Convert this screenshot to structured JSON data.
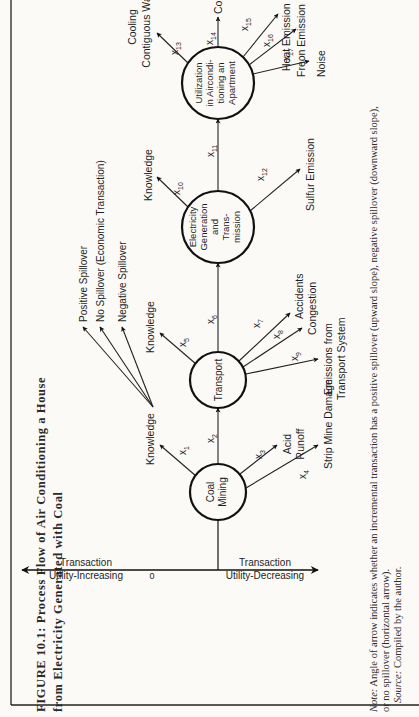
{
  "figure": {
    "title_line1": "FIGURE 10.1:  Process Flow of Air Conditioning a House",
    "title_line2": "from Electricity Generated with Coal",
    "note_label": "Note:",
    "note_line1": " Angle of arrow indicates whether an incremental transaction has a positive spillover (upward slope), negative spillover (downward slope),",
    "note_line2": "or no spillover (horizontal arrow).",
    "source_label": "Source:",
    "source_text": "  Compiled by the author.",
    "orientation": "rotated 90° counterclockwise"
  },
  "legend": {
    "items": [
      {
        "label": "Positive Spillover"
      },
      {
        "label": "No Spillover (Economic Transaction)"
      },
      {
        "label": "Negative Spillover"
      }
    ]
  },
  "axis": {
    "top_label_line1": "Utility-Increasing",
    "top_label_line2": "Transaction",
    "bottom_label_line1": "Utility-Decreasing",
    "bottom_label_line2": "Transaction",
    "origin": "0"
  },
  "nodes": [
    {
      "id": "coal",
      "lines": [
        "Coal",
        "Mining"
      ]
    },
    {
      "id": "transport",
      "lines": [
        "Transport"
      ]
    },
    {
      "id": "electricity",
      "lines": [
        "Electricity",
        "Generation",
        "and",
        "Trans-",
        "mission"
      ]
    },
    {
      "id": "utilization",
      "lines": [
        "Utilization",
        "in Aircondi-",
        "tioning  an",
        "Apartment"
      ]
    }
  ],
  "flows": [
    {
      "var": "x1",
      "sub": "1",
      "label": "Knowledge",
      "type": "positive"
    },
    {
      "var": "x2",
      "sub": "2",
      "label": "",
      "type": "none"
    },
    {
      "var": "x3",
      "sub": "3",
      "label_lines": [
        "Acid",
        "Runoff"
      ],
      "type": "negative"
    },
    {
      "var": "x4",
      "sub": "4",
      "label": "Strip Mine Damage",
      "type": "negative"
    },
    {
      "var": "x5",
      "sub": "5",
      "label": "Knowledge",
      "type": "positive"
    },
    {
      "var": "x6",
      "sub": "6",
      "label": "",
      "type": "none"
    },
    {
      "var": "x7",
      "sub": "7",
      "label": "Accidents",
      "type": "negative"
    },
    {
      "var": "x8",
      "sub": "8",
      "label": "Congestion",
      "type": "negative"
    },
    {
      "var": "x9",
      "sub": "9",
      "label_lines": [
        "Emissions from",
        "Transport System"
      ],
      "type": "negative"
    },
    {
      "var": "x10",
      "sub": "10",
      "label": "Knowledge",
      "type": "positive"
    },
    {
      "var": "x11",
      "sub": "11",
      "label": "",
      "type": "none"
    },
    {
      "var": "x12",
      "sub": "12",
      "label": "Sulfur Emission",
      "type": "negative"
    },
    {
      "var": "x13",
      "sub": "13",
      "label_lines": [
        "Cooling",
        "Contiguous Walls"
      ],
      "type": "positive"
    },
    {
      "var": "x14",
      "sub": "14",
      "label": "Cool Air",
      "type": "none"
    },
    {
      "var": "x15",
      "sub": "15",
      "label": "Heat Emission",
      "type": "negative"
    },
    {
      "var": "x16",
      "sub": "16",
      "label": "Freon Emission",
      "type": "negative"
    },
    {
      "var": "x17",
      "sub": "17",
      "label": "Noise",
      "type": "negative"
    }
  ],
  "labels": {
    "x": "x",
    "k1": "Knowledge",
    "k5": "Knowledge",
    "k10": "Knowledge",
    "acid": "Acid",
    "runoff": "Runoff",
    "strip": "Strip Mine Damage",
    "accidents": "Accidents",
    "congestion": "Congestion",
    "emissions1": "Emissions from",
    "emissions2": "Transport System",
    "sulfur": "Sulfur Emission",
    "cooling1": "Cooling",
    "cooling2": "Contiguous Walls",
    "coolair": "Cool Air",
    "heat": "Heat Emission",
    "freon": "Freon Emission",
    "noise": "Noise"
  }
}
